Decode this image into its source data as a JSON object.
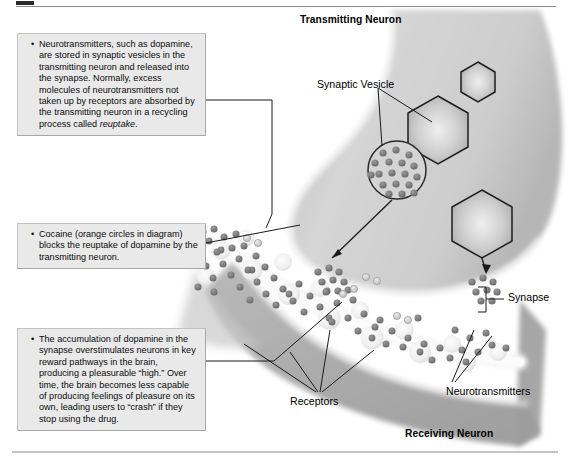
{
  "figure": {
    "rules": {
      "top": true,
      "bottom": true
    }
  },
  "callouts": [
    {
      "id": "reuptake",
      "name": "callout-reuptake",
      "text_before_italic": "Neurotransmitters, such as dopamine, are stored in synaptic vesicles in the transmitting neuron and released into the synapse. Normally, excess molecules of neurotransmitters not taken up by receptors are absorbed by the transmitting neuron in a recycling process called ",
      "italic_word": "reuptake",
      "text_after_italic": "."
    },
    {
      "id": "cocaine",
      "name": "callout-cocaine",
      "text": "Cocaine (orange circles in diagram) blocks the reuptake of dopamine by the transmitting neuron."
    },
    {
      "id": "accumulation",
      "name": "callout-accumulation",
      "text": "The accumulation of dopamine in the synapse overstimulates neurons in key reward pathways in the brain, producing a pleasurable “high.” Over time, the brain becomes less capable of producing feelings of pleasure on its own, leading users to “crash” if they stop using the drug."
    }
  ],
  "labels": {
    "transmitting_neuron": "Transmitting Neuron",
    "synaptic_vesicle": "Synaptic Vesicle",
    "synapse": "Synapse",
    "neurotransmitters": "Neurotransmitters",
    "receptors": "Receptors",
    "receiving_neuron": "Receiving Neuron"
  },
  "colors": {
    "page_background": "#ffffff",
    "callout_fill": "#e9e9e9",
    "callout_border": "#c2c2c2",
    "neuron_fill_light": "#d2d2d2",
    "neuron_fill_dark": "#a9a9a9",
    "membrane_highlight": "#f4f4f4",
    "neurotransmitter_dot": "#6f6f6f",
    "cocaine_circle": "#c9c9c9",
    "outline": "#1a1a1a",
    "leader_line": "#1a1a1a",
    "rule": "#8a8a8a"
  },
  "diagram_elements": {
    "hexagon_vesicles": 3,
    "round_vesicle_clusters": 3,
    "receptor_bumps": 11,
    "transmitting_neuron_position": "upper right",
    "receiving_neuron_position": "lower right"
  }
}
